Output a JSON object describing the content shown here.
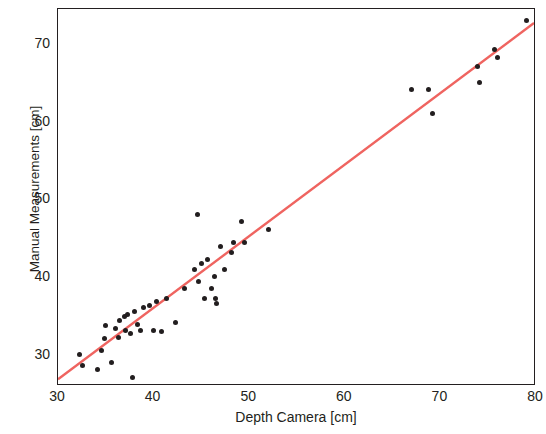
{
  "chart_data": {
    "type": "scatter",
    "title": "",
    "xlabel": "Depth Camera [cm]",
    "ylabel": "Manual Measurements [cm]",
    "xlim": [
      30,
      80
    ],
    "ylim": [
      26,
      74.5
    ],
    "xticks": [
      30,
      40,
      50,
      60,
      70,
      80
    ],
    "yticks": [
      30,
      40,
      50,
      60,
      70
    ],
    "grid": false,
    "legend": null,
    "point_color": "#221e1f",
    "line_color": "#ef6460",
    "series": [
      {
        "name": "Measurements",
        "type": "scatter",
        "points": [
          [
            32.2,
            30.0
          ],
          [
            32.6,
            28.6
          ],
          [
            34.1,
            28.1
          ],
          [
            34.6,
            30.6
          ],
          [
            34.9,
            32.1
          ],
          [
            35.0,
            33.8
          ],
          [
            35.6,
            29.0
          ],
          [
            36.0,
            33.4
          ],
          [
            36.3,
            32.2
          ],
          [
            36.4,
            34.4
          ],
          [
            37.0,
            34.9
          ],
          [
            37.1,
            33.2
          ],
          [
            37.3,
            35.2
          ],
          [
            37.6,
            32.8
          ],
          [
            37.8,
            27.1
          ],
          [
            38.0,
            35.6
          ],
          [
            38.3,
            33.9
          ],
          [
            38.6,
            33.1
          ],
          [
            38.9,
            36.1
          ],
          [
            39.6,
            36.4
          ],
          [
            40.0,
            33.1
          ],
          [
            40.3,
            36.9
          ],
          [
            40.8,
            33.0
          ],
          [
            41.3,
            37.3
          ],
          [
            42.3,
            34.2
          ],
          [
            43.2,
            38.6
          ],
          [
            44.3,
            41.0
          ],
          [
            44.6,
            48.1
          ],
          [
            44.7,
            39.5
          ],
          [
            45.0,
            41.8
          ],
          [
            45.3,
            37.2
          ],
          [
            45.6,
            42.3
          ],
          [
            46.1,
            38.6
          ],
          [
            46.4,
            40.1
          ],
          [
            46.5,
            37.3
          ],
          [
            46.6,
            36.6
          ],
          [
            47.0,
            44.0
          ],
          [
            47.4,
            41.0
          ],
          [
            48.1,
            43.2
          ],
          [
            48.4,
            44.4
          ],
          [
            49.2,
            47.1
          ],
          [
            49.5,
            44.5
          ],
          [
            52.0,
            46.1
          ],
          [
            67.0,
            64.1
          ],
          [
            68.8,
            64.1
          ],
          [
            69.2,
            61.1
          ],
          [
            73.9,
            67.1
          ],
          [
            74.1,
            65.0
          ],
          [
            75.7,
            69.3
          ],
          [
            76.0,
            68.3
          ],
          [
            79.0,
            73.0
          ]
        ]
      },
      {
        "name": "Fit line",
        "type": "line",
        "points": [
          [
            30.0,
            26.6
          ],
          [
            80.0,
            72.7
          ]
        ]
      }
    ]
  },
  "axes": {
    "x_tick_labels": [
      "30",
      "40",
      "50",
      "60",
      "70",
      "80"
    ],
    "y_tick_labels": [
      "30",
      "40",
      "50",
      "60",
      "70"
    ],
    "x_axis_label": "Depth Camera [cm]",
    "y_axis_label": "Manual Measurements [cm]"
  }
}
